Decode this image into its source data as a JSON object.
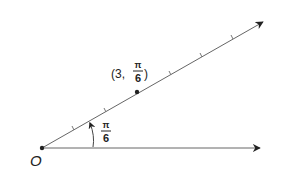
{
  "diagram": {
    "type": "polar-coordinate-plot",
    "origin_label": "O",
    "point": {
      "label_prefix": "(3,",
      "label_suffix": ")",
      "r": 3,
      "theta_numerator": "π",
      "theta_denominator": "6"
    },
    "angle": {
      "numerator": "π",
      "denominator": "6"
    },
    "ray_tick_count": 6,
    "colors": {
      "line": "#555555",
      "ink": "#222222",
      "background": "#ffffff"
    }
  }
}
